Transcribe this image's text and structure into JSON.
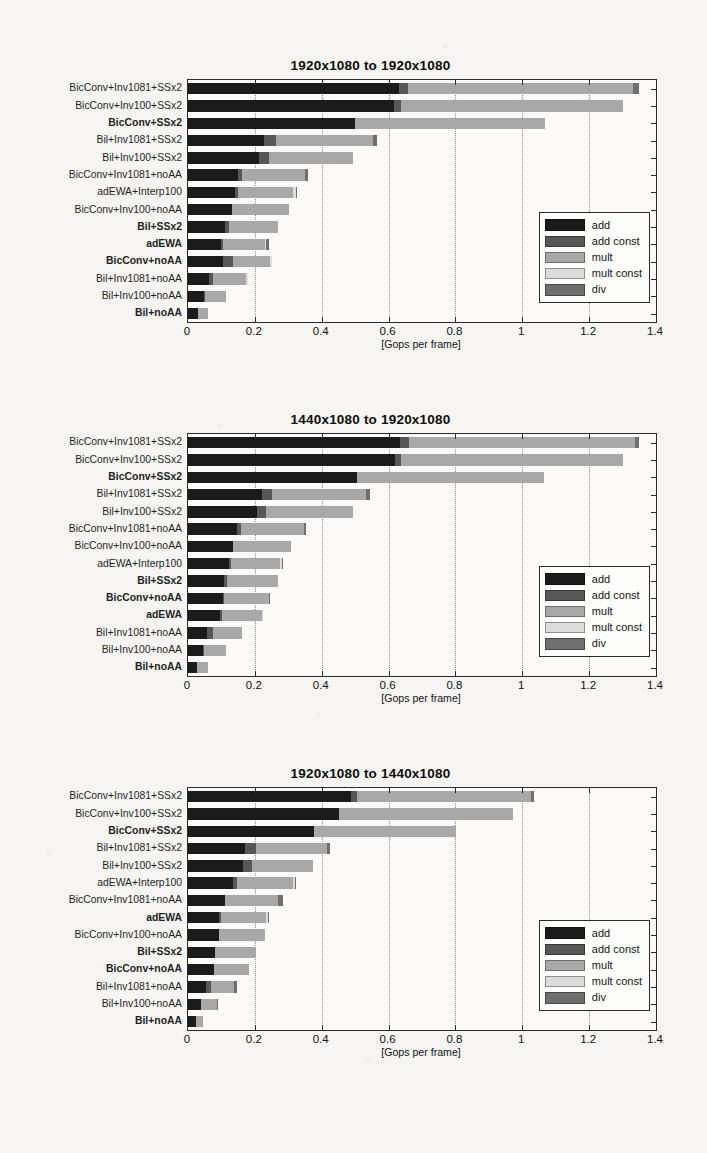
{
  "document": {
    "background_color": "#f6f5f3",
    "kind": "scanned-paper-figure"
  },
  "palette": {
    "add": "#1b1b1b",
    "add_const": "#575757",
    "mult": "#a8a8a8",
    "mult_const": "#dcdcdc",
    "div": "#6f6f6f",
    "axis": "#2b2b2b",
    "grid": "#8d8d8d"
  },
  "legend": {
    "entries": [
      {
        "label": "add",
        "color_key": "add"
      },
      {
        "label": "add const",
        "color_key": "add_const"
      },
      {
        "label": "mult",
        "color_key": "mult"
      },
      {
        "label": "mult const",
        "color_key": "mult_const"
      },
      {
        "label": "div",
        "color_key": "div"
      }
    ]
  },
  "axis": {
    "xlabel": "[Gops per frame]",
    "xlim": [
      0,
      1.4
    ],
    "xticks": [
      0,
      0.2,
      0.4,
      0.6,
      0.8,
      1,
      1.2,
      1.4
    ],
    "xticklabels": [
      "0",
      "0.2",
      "0.4",
      "0.6",
      "0.8",
      "1",
      "1.2",
      "1.4"
    ],
    "grid": true
  },
  "chart_data": [
    {
      "type": "bar",
      "orientation": "horizontal",
      "stacked": true,
      "title": "1920x1080 to 1920x1080",
      "xlabel": "[Gops per frame]",
      "ylabel": "",
      "xlim": [
        0,
        1.4
      ],
      "grid": true,
      "legend_position": "middle-right",
      "series": [
        {
          "name": "add",
          "values": [
            0.63,
            0.615,
            0.5,
            0.228,
            0.212,
            0.15,
            0.141,
            0.133,
            0.112,
            0.1,
            0.104,
            0.062,
            0.048,
            0.03
          ]
        },
        {
          "name": "add const",
          "values": [
            0.028,
            0.022,
            0.0,
            0.035,
            0.03,
            0.012,
            0.008,
            0.0,
            0.01,
            0.004,
            0.03,
            0.014,
            0.004,
            0.0
          ]
        },
        {
          "name": "mult",
          "values": [
            0.672,
            0.663,
            0.568,
            0.29,
            0.252,
            0.188,
            0.166,
            0.17,
            0.148,
            0.125,
            0.112,
            0.098,
            0.062,
            0.03
          ]
        },
        {
          "name": "mult const",
          "values": [
            0.0,
            0.0,
            0.0,
            0.0,
            0.0,
            0.0,
            0.008,
            0.0,
            0.0,
            0.002,
            0.004,
            0.006,
            0.0,
            0.0
          ]
        },
        {
          "name": "div",
          "values": [
            0.018,
            0.0,
            0.0,
            0.012,
            0.0,
            0.01,
            0.002,
            0.0,
            0.0,
            0.01,
            0.0,
            0.0,
            0.0,
            0.0
          ]
        }
      ],
      "categories": [
        {
          "label": "BicConv+Inv1081+SSx2",
          "bold": false,
          "total": 1.348
        },
        {
          "label": "BicConv+Inv100+SSx2",
          "bold": false,
          "total": 1.3
        },
        {
          "label": "BicConv+SSx2",
          "bold": true,
          "total": 1.068
        },
        {
          "label": "Bil+Inv1081+SSx2",
          "bold": false,
          "total": 0.565
        },
        {
          "label": "Bil+Inv100+SSx2",
          "bold": false,
          "total": 0.494
        },
        {
          "label": "BicConv+Inv1081+noAA",
          "bold": false,
          "total": 0.36
        },
        {
          "label": "adEWA+Interp100",
          "bold": false,
          "total": 0.325
        },
        {
          "label": "BicConv+Inv100+noAA",
          "bold": false,
          "total": 0.303
        },
        {
          "label": "Bil+SSx2",
          "bold": true,
          "total": 0.27
        },
        {
          "label": "adEWA",
          "bold": true,
          "total": 0.241
        },
        {
          "label": "BicConv+noAA",
          "bold": true,
          "total": 0.25
        },
        {
          "label": "Bil+Inv1081+noAA",
          "bold": false,
          "total": 0.18
        },
        {
          "label": "Bil+Inv100+noAA",
          "bold": false,
          "total": 0.114
        },
        {
          "label": "Bil+noAA",
          "bold": true,
          "total": 0.06
        }
      ]
    },
    {
      "type": "bar",
      "orientation": "horizontal",
      "stacked": true,
      "title": "1440x1080 to 1920x1080",
      "xlabel": "[Gops per frame]",
      "ylabel": "",
      "xlim": [
        0,
        1.4
      ],
      "grid": true,
      "legend_position": "middle-right",
      "series": [
        {
          "name": "add",
          "values": [
            0.635,
            0.618,
            0.505,
            0.222,
            0.205,
            0.148,
            0.135,
            0.122,
            0.108,
            0.104,
            0.095,
            0.058,
            0.045,
            0.028
          ]
        },
        {
          "name": "add const",
          "values": [
            0.026,
            0.02,
            0.0,
            0.03,
            0.028,
            0.012,
            0.0,
            0.006,
            0.01,
            0.004,
            0.006,
            0.018,
            0.004,
            0.0
          ]
        },
        {
          "name": "mult",
          "values": [
            0.675,
            0.662,
            0.56,
            0.282,
            0.262,
            0.186,
            0.172,
            0.148,
            0.152,
            0.134,
            0.12,
            0.085,
            0.065,
            0.032
          ]
        },
        {
          "name": "mult const",
          "values": [
            0.0,
            0.0,
            0.0,
            0.0,
            0.0,
            0.0,
            0.0,
            0.006,
            0.0,
            0.0,
            0.004,
            0.0,
            0.0,
            0.0
          ]
        },
        {
          "name": "div",
          "values": [
            0.014,
            0.0,
            0.0,
            0.012,
            0.0,
            0.008,
            0.0,
            0.002,
            0.0,
            0.002,
            0.0,
            0.0,
            0.0,
            0.0
          ]
        }
      ],
      "categories": [
        {
          "label": "BicConv+Inv1081+SSx2",
          "bold": false,
          "total": 1.35
        },
        {
          "label": "BicConv+Inv100+SSx2",
          "bold": false,
          "total": 1.3
        },
        {
          "label": "BicConv+SSx2",
          "bold": true,
          "total": 1.065
        },
        {
          "label": "Bil+Inv1081+SSx2",
          "bold": false,
          "total": 0.546
        },
        {
          "label": "Bil+Inv100+SSx2",
          "bold": false,
          "total": 0.495
        },
        {
          "label": "BicConv+Inv1081+noAA",
          "bold": false,
          "total": 0.354
        },
        {
          "label": "BicConv+Inv100+noAA",
          "bold": false,
          "total": 0.307
        },
        {
          "label": "adEWA+Interp100",
          "bold": false,
          "total": 0.284
        },
        {
          "label": "Bil+SSx2",
          "bold": true,
          "total": 0.27
        },
        {
          "label": "BicConv+noAA",
          "bold": true,
          "total": 0.244
        },
        {
          "label": "adEWA",
          "bold": true,
          "total": 0.225
        },
        {
          "label": "Bil+Inv1081+noAA",
          "bold": false,
          "total": 0.161
        },
        {
          "label": "Bil+Inv100+noAA",
          "bold": false,
          "total": 0.114
        },
        {
          "label": "Bil+noAA",
          "bold": true,
          "total": 0.06
        }
      ]
    },
    {
      "type": "bar",
      "orientation": "horizontal",
      "stacked": true,
      "title": "1920x1080 to 1440x1080",
      "xlabel": "[Gops per frame]",
      "ylabel": "",
      "xlim": [
        0,
        1.4
      ],
      "grid": true,
      "legend_position": "middle-right",
      "series": [
        {
          "name": "add",
          "values": [
            0.487,
            0.452,
            0.378,
            0.172,
            0.166,
            0.136,
            0.112,
            0.092,
            0.092,
            0.082,
            0.078,
            0.055,
            0.038,
            0.024
          ]
        },
        {
          "name": "add const",
          "values": [
            0.018,
            0.0,
            0.0,
            0.032,
            0.026,
            0.01,
            0.0,
            0.008,
            0.0,
            0.0,
            0.0,
            0.014,
            0.0,
            0.0
          ]
        },
        {
          "name": "mult",
          "values": [
            0.52,
            0.52,
            0.424,
            0.212,
            0.182,
            0.168,
            0.158,
            0.132,
            0.138,
            0.122,
            0.106,
            0.07,
            0.048,
            0.02
          ]
        },
        {
          "name": "mult const",
          "values": [
            0.0,
            0.0,
            0.0,
            0.0,
            0.0,
            0.006,
            0.0,
            0.006,
            0.0,
            0.0,
            0.0,
            0.0,
            0.0,
            0.0
          ]
        },
        {
          "name": "div",
          "values": [
            0.01,
            0.0,
            0.0,
            0.01,
            0.0,
            0.002,
            0.014,
            0.004,
            0.0,
            0.0,
            0.0,
            0.008,
            0.004,
            0.0
          ]
        }
      ],
      "categories": [
        {
          "label": "BicConv+Inv1081+SSx2",
          "bold": false,
          "total": 1.035
        },
        {
          "label": "BicConv+Inv100+SSx2",
          "bold": false,
          "total": 0.972
        },
        {
          "label": "BicConv+SSx2",
          "bold": true,
          "total": 0.802
        },
        {
          "label": "Bil+Inv1081+SSx2",
          "bold": false,
          "total": 0.426
        },
        {
          "label": "Bil+Inv100+SSx2",
          "bold": false,
          "total": 0.374
        },
        {
          "label": "adEWA+Interp100",
          "bold": false,
          "total": 0.322
        },
        {
          "label": "BicConv+Inv1081+noAA",
          "bold": false,
          "total": 0.284
        },
        {
          "label": "adEWA",
          "bold": true,
          "total": 0.242
        },
        {
          "label": "BicConv+Inv100+noAA",
          "bold": false,
          "total": 0.23
        },
        {
          "label": "Bil+SSx2",
          "bold": true,
          "total": 0.204
        },
        {
          "label": "BicConv+noAA",
          "bold": true,
          "total": 0.184
        },
        {
          "label": "Bil+Inv1081+noAA",
          "bold": false,
          "total": 0.147
        },
        {
          "label": "Bil+Inv100+noAA",
          "bold": false,
          "total": 0.09
        },
        {
          "label": "Bil+noAA",
          "bold": true,
          "total": 0.044
        }
      ]
    }
  ]
}
